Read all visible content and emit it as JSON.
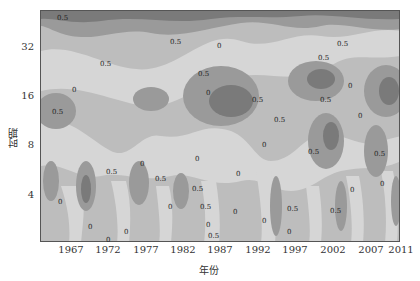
{
  "chart_data": {
    "type": "heatmap",
    "subtype": "wavelet contour (filled) plot",
    "title": "",
    "xlabel": "年份",
    "ylabel": "时期",
    "x_ticks": [
      "1967",
      "1972",
      "1977",
      "1982",
      "1987",
      "1992",
      "1997",
      "2002",
      "2007",
      "2011"
    ],
    "y_ticks": [
      "4",
      "8",
      "16",
      "32"
    ],
    "y_scale": "log2",
    "xlim": [
      1963,
      2011
    ],
    "ylim": [
      2,
      50
    ],
    "contour_levels": [
      "-0.5",
      "0",
      "0.5"
    ],
    "contour_labels_visible": [
      "0",
      "0.5"
    ],
    "colormap": "grayscale (darker = higher positive value)",
    "grid": false,
    "legend": "none"
  },
  "axes": {
    "xlabel": "年份",
    "ylabel": "时期",
    "x_ticks": [
      {
        "label": "1967",
        "x": 71
      },
      {
        "label": "1972",
        "x": 108
      },
      {
        "label": "1977",
        "x": 146
      },
      {
        "label": "1982",
        "x": 183
      },
      {
        "label": "1987",
        "x": 220
      },
      {
        "label": "1992",
        "x": 258
      },
      {
        "label": "1997",
        "x": 295
      },
      {
        "label": "2002",
        "x": 333
      },
      {
        "label": "2007",
        "x": 371
      },
      {
        "label": "2011",
        "x": 401
      }
    ],
    "y_ticks": [
      {
        "label": "32",
        "y": 47
      },
      {
        "label": "16",
        "y": 96
      },
      {
        "label": "8",
        "y": 145
      },
      {
        "label": "4",
        "y": 195
      }
    ]
  },
  "contour_text": [
    {
      "t": "0.5",
      "x": 57,
      "y": 14
    },
    {
      "t": "0.5",
      "x": 52,
      "y": 108
    },
    {
      "t": "0.5",
      "x": 100,
      "y": 60
    },
    {
      "t": "0",
      "x": 72,
      "y": 86
    },
    {
      "t": "0.5",
      "x": 170,
      "y": 38
    },
    {
      "t": "0",
      "x": 217,
      "y": 42
    },
    {
      "t": "0.5",
      "x": 198,
      "y": 70
    },
    {
      "t": "0",
      "x": 206,
      "y": 89
    },
    {
      "t": "0.5",
      "x": 252,
      "y": 96
    },
    {
      "t": "0.5",
      "x": 274,
      "y": 116
    },
    {
      "t": "0",
      "x": 262,
      "y": 141
    },
    {
      "t": "0.5",
      "x": 337,
      "y": 40
    },
    {
      "t": "0.5",
      "x": 318,
      "y": 54
    },
    {
      "t": "0",
      "x": 348,
      "y": 82
    },
    {
      "t": "0.5",
      "x": 320,
      "y": 96
    },
    {
      "t": "0",
      "x": 358,
      "y": 112
    },
    {
      "t": "0.5",
      "x": 308,
      "y": 148
    },
    {
      "t": "0.5",
      "x": 374,
      "y": 150
    },
    {
      "t": "0.5",
      "x": 106,
      "y": 168
    },
    {
      "t": "0",
      "x": 140,
      "y": 160
    },
    {
      "t": "0.5",
      "x": 155,
      "y": 175
    },
    {
      "t": "0",
      "x": 195,
      "y": 155
    },
    {
      "t": "0.5",
      "x": 192,
      "y": 185
    },
    {
      "t": "0",
      "x": 236,
      "y": 170
    },
    {
      "t": "0",
      "x": 168,
      "y": 203
    },
    {
      "t": "0.5",
      "x": 200,
      "y": 203
    },
    {
      "t": "0",
      "x": 233,
      "y": 208
    },
    {
      "t": "0",
      "x": 206,
      "y": 221
    },
    {
      "t": "0.5",
      "x": 208,
      "y": 232
    },
    {
      "t": "0",
      "x": 262,
      "y": 217
    },
    {
      "t": "0.5",
      "x": 287,
      "y": 205
    },
    {
      "t": "0",
      "x": 287,
      "y": 228
    },
    {
      "t": "0.5",
      "x": 330,
      "y": 207
    },
    {
      "t": "0",
      "x": 350,
      "y": 186
    },
    {
      "t": "0",
      "x": 380,
      "y": 180
    },
    {
      "t": "0",
      "x": 58,
      "y": 198
    },
    {
      "t": "0",
      "x": 88,
      "y": 223
    },
    {
      "t": "0",
      "x": 106,
      "y": 236
    },
    {
      "t": "0",
      "x": 124,
      "y": 228
    }
  ],
  "colors": {
    "level_low": "#d6d6d6",
    "level_mid": "#bdbdbd",
    "level_high": "#9a9a9a",
    "level_peak": "#7a7a7a",
    "axis": "#555555"
  }
}
